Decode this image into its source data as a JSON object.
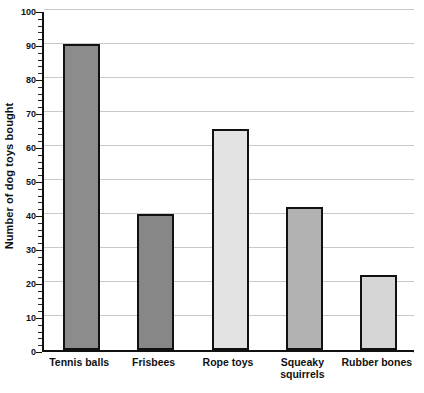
{
  "chart_data": {
    "type": "bar",
    "title": "",
    "xlabel": "",
    "ylabel": "Number of dog toys bought",
    "categories": [
      "Tennis balls",
      "Frisbees",
      "Rope toys",
      "Squeaky squirrels",
      "Rubber bones"
    ],
    "values": [
      90,
      40,
      65,
      42,
      22
    ],
    "bar_colors": [
      "#8c8c8c",
      "#878787",
      "#e3e3e3",
      "#b2b2b2",
      "#d6d6d6"
    ],
    "bar_edge_color": "#111111",
    "ylim": [
      0,
      100
    ],
    "y_major_ticks": [
      0,
      10,
      20,
      30,
      40,
      50,
      60,
      70,
      80,
      90,
      100
    ],
    "y_tick_labels": [
      "0",
      "10",
      "20",
      "30",
      "40",
      "50",
      "60",
      "70",
      "80",
      "90",
      "100"
    ],
    "y_minor_tick_step": 2,
    "grid": true,
    "grid_axis": "y",
    "grid_color": "#c9c9c9",
    "legend": false,
    "legend_position": "none",
    "background": "#ffffff"
  }
}
